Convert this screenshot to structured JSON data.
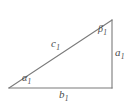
{
  "figure": {
    "type": "right-triangle-diagram",
    "background_color": "#ffffff",
    "stroke_color": "#7a7a7a",
    "label_color": "#4a4a4a",
    "vertices": {
      "left": [
        9,
        88
      ],
      "bottom_right": [
        112,
        88
      ],
      "top_right": [
        112,
        20
      ]
    },
    "sides": {
      "hypotenuse": {
        "name": "c-side",
        "label": "c",
        "subscript": "1",
        "from": [
          9,
          88
        ],
        "to": [
          112,
          20
        ]
      },
      "base": {
        "name": "b-side",
        "label": "b",
        "subscript": "1",
        "from": [
          9,
          88
        ],
        "to": [
          112,
          88
        ]
      },
      "vertical": {
        "name": "a-side",
        "label": "a",
        "subscript": "1",
        "from": [
          112,
          88
        ],
        "to": [
          112,
          20
        ]
      }
    },
    "angles": {
      "left": {
        "name": "alpha-angle",
        "label": "α",
        "subscript": "1",
        "at_vertex": [
          9,
          88
        ]
      },
      "top": {
        "name": "beta-angle",
        "label": "β",
        "subscript": "1",
        "at_vertex": [
          112,
          20
        ]
      }
    }
  },
  "labels": {
    "c1": {
      "symbol": "c",
      "subscript": "1"
    },
    "b1": {
      "symbol": "b",
      "subscript": "1"
    },
    "a1": {
      "symbol": "a",
      "subscript": "1"
    },
    "alpha1": {
      "symbol": "α",
      "subscript": "1"
    },
    "beta1": {
      "symbol": "β",
      "subscript": "1"
    }
  }
}
